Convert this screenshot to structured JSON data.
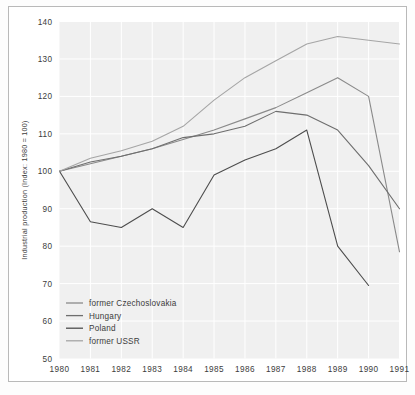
{
  "chart_data": {
    "type": "line",
    "title": "",
    "xlabel": "",
    "ylabel": "Industrial production (Index: 1980 = 100)",
    "x": [
      1980,
      1981,
      1982,
      1983,
      1984,
      1985,
      1986,
      1987,
      1988,
      1989,
      1990,
      1991
    ],
    "xticklabels": [
      "1980",
      "1981",
      "1982",
      "1983",
      "1984",
      "1985",
      "1986",
      "1987",
      "1988",
      "1989",
      "1990",
      "1991"
    ],
    "yticklabels": [
      "140",
      "130",
      "120",
      "110",
      "100",
      "90",
      "80",
      "70",
      "60",
      "50"
    ],
    "yticks": [
      140,
      130,
      120,
      110,
      100,
      90,
      80,
      70,
      60,
      50
    ],
    "ylim": [
      50,
      140
    ],
    "xlim": [
      1980,
      1991
    ],
    "grid": true,
    "legend_position": "bottom-left",
    "plot_background": "#f0f0f0",
    "grid_color": "#ffffff",
    "series": [
      {
        "name": "former Czechoslovakia",
        "color": "#8a8a8a",
        "values": [
          100,
          102,
          104,
          106,
          108.5,
          111,
          114,
          117,
          121,
          125,
          120,
          78.5
        ]
      },
      {
        "name": "Hungary",
        "color": "#6e6e6e",
        "values": [
          100,
          102.5,
          104,
          106,
          109,
          110,
          112,
          116,
          115,
          111,
          101.5,
          90
        ]
      },
      {
        "name": "Poland",
        "color": "#4d4d4d",
        "values": [
          100,
          86.5,
          85,
          90,
          85,
          99,
          103,
          106,
          111,
          80,
          69.5,
          null
        ]
      },
      {
        "name": "former USSR",
        "color": "#a5a5a5",
        "values": [
          100,
          103.5,
          105.5,
          108,
          112,
          119,
          125,
          129.5,
          134,
          136,
          135,
          134
        ]
      }
    ]
  }
}
